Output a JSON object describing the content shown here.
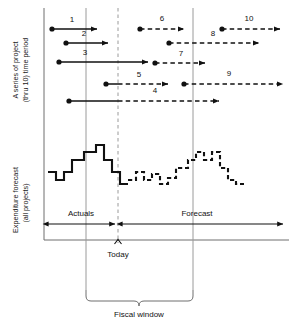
{
  "figure": {
    "top_axis_title_line1": "A series of project",
    "top_axis_title_line2": "(thru 10) time period",
    "bottom_axis_title_line1": "Expenditure forecast",
    "bottom_axis_title_line2": "(all projects)",
    "today_label": "Today",
    "fiscal_window_label": "Fiscal window",
    "actuals_label": "Actuals",
    "forecast_label": "Forecast",
    "colors": {
      "ink": "#111111",
      "grid": "#9a9a9a",
      "frame": "#6e6e6e",
      "background": "#ffffff"
    }
  },
  "chart_data": {
    "type": "diagram",
    "axes": {
      "top_panel_ylabel": "A series of project (thru 10) time period",
      "bottom_panel_ylabel": "Expenditure forecast (all projects)",
      "xlabel": "Fiscal window",
      "grid": false
    },
    "markers": {
      "today_x": 118,
      "fiscal_window_start_x": 86,
      "fiscal_window_end_x": 193,
      "plot_left_x": 44,
      "plot_right_x": 283
    },
    "project_bars": [
      {
        "id": "1",
        "label": "1",
        "row_y": 29,
        "start_x": 52,
        "solid_end_x": 97,
        "end_x": 97,
        "style": "solid",
        "label_x": 72,
        "label_y": 22
      },
      {
        "id": "2",
        "label": "2",
        "row_y": 43,
        "start_x": 66,
        "solid_end_x": 108,
        "end_x": 108,
        "style": "solid",
        "label_x": 84,
        "label_y": 36
      },
      {
        "id": "3",
        "label": "3",
        "row_y": 62,
        "start_x": 59,
        "solid_end_x": 148,
        "end_x": 148,
        "style": "solid",
        "label_x": 85,
        "label_y": 55
      },
      {
        "id": "4",
        "label": "4",
        "row_y": 101,
        "start_x": 69,
        "solid_end_x": 118,
        "end_x": 219,
        "style": "mixed",
        "label_x": 155,
        "label_y": 93
      },
      {
        "id": "5",
        "label": "5",
        "row_y": 84,
        "start_x": 106,
        "solid_end_x": 118,
        "end_x": 168,
        "style": "mixed",
        "label_x": 139,
        "label_y": 77
      },
      {
        "id": "6",
        "label": "6",
        "row_y": 29,
        "start_x": 140,
        "solid_end_x": 140,
        "end_x": 184,
        "style": "dashed",
        "label_x": 162,
        "label_y": 21
      },
      {
        "id": "7",
        "label": "7",
        "row_y": 63,
        "start_x": 155,
        "solid_end_x": 155,
        "end_x": 205,
        "style": "dashed",
        "label_x": 181,
        "label_y": 56
      },
      {
        "id": "8",
        "label": "8",
        "row_y": 43,
        "start_x": 169,
        "solid_end_x": 169,
        "end_x": 259,
        "style": "dashed",
        "label_x": 213,
        "label_y": 36
      },
      {
        "id": "9",
        "label": "9",
        "row_y": 84,
        "start_x": 184,
        "solid_end_x": 184,
        "end_x": 283,
        "style": "dashed",
        "label_x": 229,
        "label_y": 76
      },
      {
        "id": "10",
        "label": "10",
        "row_y": 29,
        "start_x": 222,
        "solid_end_x": 222,
        "end_x": 280,
        "style": "dashed",
        "label_x": 249,
        "label_y": 21
      }
    ],
    "expenditure_steps": {
      "baseline_y": 196,
      "step_width": 8,
      "actual_values": [
        172,
        172,
        180,
        180,
        172,
        172,
        160,
        160,
        160,
        152,
        152,
        152,
        145,
        145,
        160,
        160,
        172,
        172,
        184,
        184
      ],
      "forecast_values": [
        180,
        180,
        172,
        172,
        180,
        180,
        174,
        174,
        184,
        184,
        178,
        178,
        168,
        168,
        168,
        160,
        160,
        152,
        152,
        160,
        160,
        152,
        152,
        168,
        168,
        180,
        180,
        184,
        184
      ],
      "actual_style": "solid",
      "forecast_style": "dashed",
      "note": "Step (staircase) profile of expenditure: solid before Today, dashed after Today"
    }
  }
}
